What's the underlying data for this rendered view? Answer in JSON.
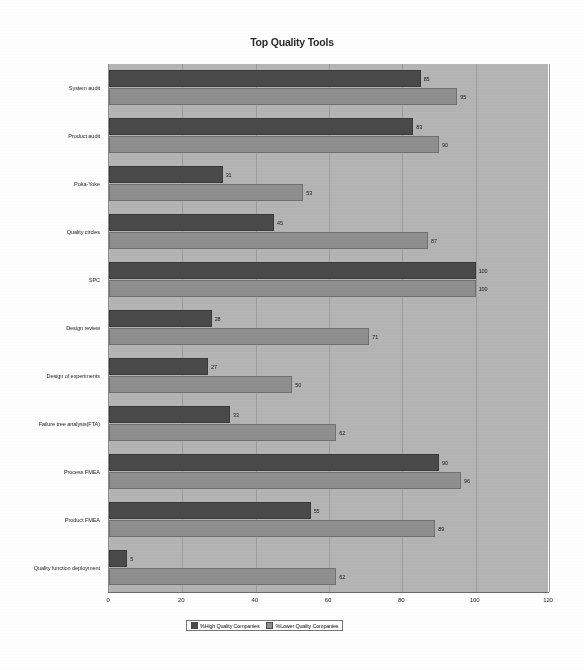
{
  "chart_data": {
    "type": "bar",
    "orientation": "horizontal",
    "title": "Top Quality Tools",
    "xlabel": "",
    "ylabel": "",
    "xlim": [
      0,
      120
    ],
    "xticks": [
      0,
      20,
      40,
      60,
      80,
      100,
      120
    ],
    "grid": true,
    "legend_position": "bottom-center",
    "categories": [
      "System audit",
      "Product audit",
      "Poka-Yoke",
      "Quality circles",
      "SPC",
      "Design review",
      "Design of experiments",
      "Failure tree analysis(FTA)",
      "Process FMEA",
      "Product FMEA",
      "Quality function deployment"
    ],
    "series": [
      {
        "name": "%High Quality Companies",
        "color": "#4a4a4a",
        "values": [
          85,
          83,
          31,
          45,
          100,
          28,
          27,
          33,
          90,
          55,
          5
        ]
      },
      {
        "name": "%Lower Quality Companies",
        "color": "#8f8f8f",
        "values": [
          95,
          90,
          53,
          87,
          100,
          71,
          50,
          62,
          96,
          89,
          62
        ]
      }
    ]
  },
  "plot": {
    "background_color": "#b4b4b4",
    "page_background": "#ffffff"
  }
}
